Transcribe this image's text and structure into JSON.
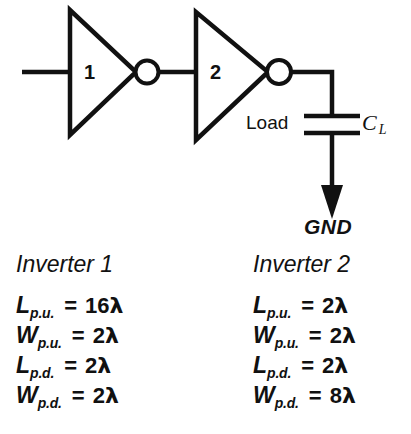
{
  "schematic": {
    "input_wire": "input-wire",
    "inverters": [
      {
        "number": "1",
        "bubble": "inverting-bubble"
      },
      {
        "number": "2",
        "bubble": "inverting-bubble"
      }
    ],
    "load_label": "Load",
    "capacitor_label": {
      "symbol": "C",
      "subscript": "L"
    },
    "ground_label": "GND"
  },
  "columns": [
    {
      "title": "Inverter 1",
      "rows": [
        {
          "symbol": "L",
          "subscript": "p.u.",
          "equals": "=",
          "value": "16",
          "unit": "λ"
        },
        {
          "symbol": "W",
          "subscript": "p.u.",
          "equals": "=",
          "value": "2",
          "unit": "λ"
        },
        {
          "symbol": "L",
          "subscript": "p.d.",
          "equals": "=",
          "value": "2",
          "unit": "λ"
        },
        {
          "symbol": "W",
          "subscript": "p.d.",
          "equals": "=",
          "value": "2",
          "unit": "λ"
        }
      ]
    },
    {
      "title": "Inverter 2",
      "rows": [
        {
          "symbol": "L",
          "subscript": "p.u.",
          "equals": "=",
          "value": "2",
          "unit": "λ"
        },
        {
          "symbol": "W",
          "subscript": "p.u.",
          "equals": "=",
          "value": "2",
          "unit": "λ"
        },
        {
          "symbol": "L",
          "subscript": "p.d.",
          "equals": "=",
          "value": "2",
          "unit": "λ"
        },
        {
          "symbol": "W",
          "subscript": "p.d.",
          "equals": "=",
          "value": "8",
          "unit": "λ"
        }
      ]
    }
  ],
  "colors": {
    "ink": "#111111",
    "background": "#ffffff"
  }
}
